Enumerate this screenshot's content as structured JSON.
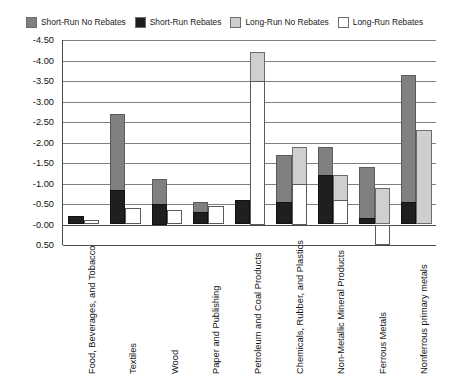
{
  "legend": {
    "position": "top",
    "items": [
      {
        "label": "Short-Run No Rebates",
        "key": "short_run_no_rebates",
        "color": "#808080"
      },
      {
        "label": "Short-Run Rebates",
        "key": "short_run_rebates",
        "color": "#1f1f1f"
      },
      {
        "label": "Long-Run No Rebates",
        "key": "long_run_no_rebates",
        "color": "#cfcfcf"
      },
      {
        "label": "Long-Run Rebates",
        "key": "long_run_rebates",
        "color": "#ffffff"
      }
    ]
  },
  "axis": {
    "y_ticks": [
      "-4.50",
      "-4.00",
      "-3.50",
      "-3.00",
      "-2.50",
      "-2.00",
      "-1.50",
      "-1.00",
      "-0.50",
      "-0.00",
      "0.50"
    ]
  },
  "chart_data": {
    "type": "bar",
    "title": "",
    "xlabel": "",
    "ylabel": "",
    "ylim": [
      -4.5,
      0.5
    ],
    "y_tick_step": 0.5,
    "y_inverted": true,
    "grid": true,
    "legend_position": "top",
    "categories": [
      "Food, Beverages, and Tobacco",
      "Textiles",
      "Wood",
      "Paper and Publishing",
      "Petroleum and Coal Products",
      "Chemicals, Rubber, and Plastics",
      "Non-Metallic Mineral Products",
      "Ferrous Metals",
      "Nonferrous primary metals"
    ],
    "series": [
      {
        "name": "Short-Run No Rebates",
        "color": "#808080",
        "values": [
          -0.2,
          -2.7,
          -1.1,
          -0.55,
          -0.6,
          -1.7,
          -1.9,
          -1.4,
          -3.65
        ]
      },
      {
        "name": "Short-Run Rebates",
        "color": "#1f1f1f",
        "values": [
          -0.2,
          -0.85,
          -0.5,
          -0.3,
          -0.6,
          -0.55,
          -1.2,
          -0.15,
          -0.55
        ]
      },
      {
        "name": "Long-Run No Rebates",
        "color": "#cfcfcf",
        "values": [
          -0.1,
          -0.4,
          -0.35,
          -0.4,
          -4.2,
          -1.9,
          -1.2,
          -0.9,
          -2.3
        ]
      },
      {
        "name": "Long-Run Rebates",
        "color": "#ffffff",
        "values": [
          -0.1,
          -0.4,
          -0.35,
          -0.45,
          -3.5,
          -1.0,
          -0.6,
          0.5,
          0.0
        ]
      }
    ]
  }
}
